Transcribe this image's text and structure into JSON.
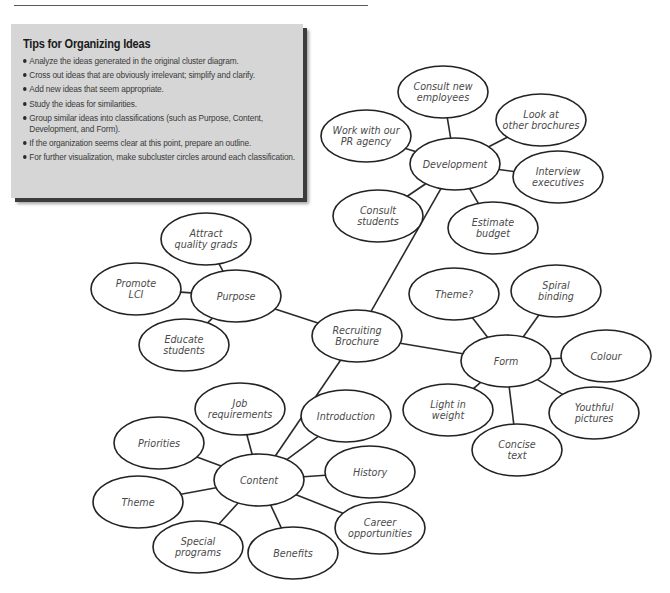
{
  "page": {
    "top_cut_text": "Planning and Organizing Ideas"
  },
  "tips": {
    "title": "Tips for Organizing Ideas",
    "items": [
      "Analyze the ideas generated in the original cluster diagram.",
      "Cross out ideas that are obviously irrelevant; simplify and clarify.",
      "Add new ideas that seem appropriate.",
      "Study the ideas for similarities.",
      "Group similar ideas into classifications (such as Purpose, Content,",
      "Development, and Form).",
      "If the organization seems clear at this point, prepare an outline.",
      "For further visualization, make subcluster circles around each classification."
    ],
    "bullets": [
      true,
      true,
      true,
      true,
      true,
      false,
      true,
      true
    ]
  },
  "diagram": {
    "center": {
      "id": "recruiting",
      "lines": [
        "Recruiting",
        "Brochure"
      ],
      "cx": 357,
      "cy": 336
    },
    "clusters": [
      {
        "id": "development",
        "lines": [
          "Development"
        ],
        "cx": 455,
        "cy": 164,
        "children": [
          {
            "id": "consult-new-employees",
            "lines": [
              "Consult new",
              "employees"
            ],
            "cx": 443,
            "cy": 92
          },
          {
            "id": "look-at-other-brochures",
            "lines": [
              "Look at",
              "other brochures"
            ],
            "cx": 541,
            "cy": 120
          },
          {
            "id": "interview-executives",
            "lines": [
              "Interview",
              "executives"
            ],
            "cx": 558,
            "cy": 177
          },
          {
            "id": "estimate-budget",
            "lines": [
              "Estimate",
              "budget"
            ],
            "cx": 493,
            "cy": 228
          },
          {
            "id": "consult-students",
            "lines": [
              "Consult",
              "students"
            ],
            "cx": 378,
            "cy": 216
          },
          {
            "id": "work-with-pr-agency",
            "lines": [
              "Work with our",
              "PR agency"
            ],
            "cx": 366,
            "cy": 136
          }
        ]
      },
      {
        "id": "purpose",
        "lines": [
          "Purpose"
        ],
        "cx": 236,
        "cy": 296,
        "children": [
          {
            "id": "attract-quality-grads",
            "lines": [
              "Attract",
              "quality grads"
            ],
            "cx": 206,
            "cy": 239
          },
          {
            "id": "promote-lci",
            "lines": [
              "Promote",
              "LCI"
            ],
            "cx": 136,
            "cy": 289
          },
          {
            "id": "educate-students",
            "lines": [
              "Educate",
              "students"
            ],
            "cx": 184,
            "cy": 345
          }
        ]
      },
      {
        "id": "form",
        "lines": [
          "Form"
        ],
        "cx": 506,
        "cy": 361,
        "children": [
          {
            "id": "theme-question",
            "lines": [
              "Theme?"
            ],
            "cx": 454,
            "cy": 294
          },
          {
            "id": "spiral-binding",
            "lines": [
              "Spiral",
              "binding"
            ],
            "cx": 556,
            "cy": 291
          },
          {
            "id": "colour",
            "lines": [
              "Colour"
            ],
            "cx": 606,
            "cy": 356
          },
          {
            "id": "youthful-pictures",
            "lines": [
              "Youthful",
              "pictures"
            ],
            "cx": 594,
            "cy": 413
          },
          {
            "id": "concise-text",
            "lines": [
              "Concise",
              "text"
            ],
            "cx": 517,
            "cy": 450
          },
          {
            "id": "light-in-weight",
            "lines": [
              "Light in",
              "weight"
            ],
            "cx": 448,
            "cy": 410
          }
        ]
      },
      {
        "id": "content",
        "lines": [
          "Content"
        ],
        "cx": 259,
        "cy": 480,
        "children": [
          {
            "id": "job-requirements",
            "lines": [
              "Job",
              "requirements"
            ],
            "cx": 240,
            "cy": 409
          },
          {
            "id": "introduction",
            "lines": [
              "Introduction"
            ],
            "cx": 346,
            "cy": 416
          },
          {
            "id": "history",
            "lines": [
              "History"
            ],
            "cx": 370,
            "cy": 472
          },
          {
            "id": "career-opportunities",
            "lines": [
              "Career",
              "opportunities"
            ],
            "cx": 380,
            "cy": 528
          },
          {
            "id": "benefits",
            "lines": [
              "Benefits"
            ],
            "cx": 293,
            "cy": 553
          },
          {
            "id": "special-programs",
            "lines": [
              "Special",
              "programs"
            ],
            "cx": 198,
            "cy": 547
          },
          {
            "id": "theme",
            "lines": [
              "Theme"
            ],
            "cx": 138,
            "cy": 502
          },
          {
            "id": "priorities",
            "lines": [
              "Priorities"
            ],
            "cx": 159,
            "cy": 443
          }
        ]
      }
    ],
    "style": {
      "rx": 45,
      "ry": 26,
      "stroke": "#222222",
      "text_color": "#4a4a4a",
      "box_bg": "#d6d6d6"
    }
  }
}
